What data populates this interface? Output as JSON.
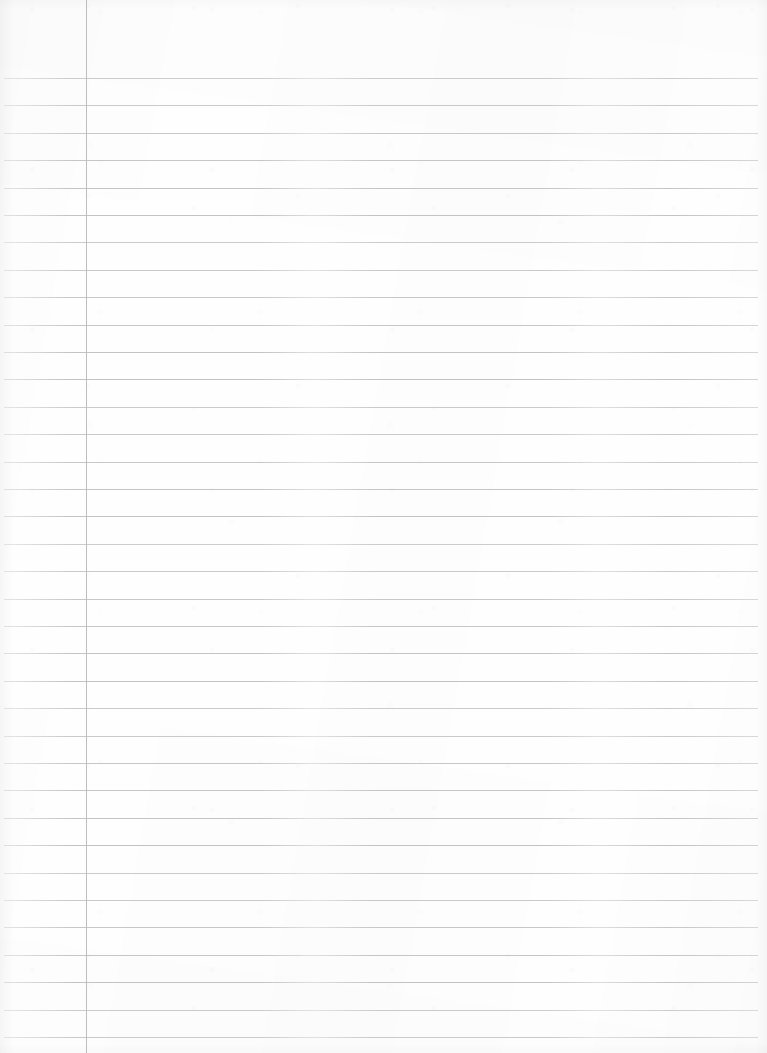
{
  "document": {
    "kind": "lined-notebook-paper",
    "title": "Blank ruled notebook page",
    "page_width": 767,
    "page_height": 1053,
    "orientation": "portrait",
    "visible_text": "",
    "content_note": "no handwriting, no printed text, no headings — page is entirely blank"
  },
  "paper": {
    "background_color": "#fefefe",
    "edge_tint_color": "#f3f3f4",
    "texture": "faint scan grain"
  },
  "ruling": {
    "style": "wide ruled with single left margin rule",
    "line_color": "#bfc0c4",
    "line_thickness_px": 1,
    "line_spacing_px": 27.4,
    "first_line_y": 78,
    "line_count": 36,
    "line_start_x": 4,
    "line_end_x": 758,
    "line_y_positions": [
      78,
      105.4,
      132.8,
      160.2,
      187.6,
      215,
      242.4,
      269.8,
      297.2,
      324.6,
      352,
      379.4,
      406.8,
      434.2,
      461.6,
      489,
      516.4,
      543.8,
      571.2,
      598.6,
      626,
      653.4,
      680.8,
      708.2,
      735.6,
      763,
      790.4,
      817.8,
      845.2,
      872.6,
      900,
      927.4,
      954.8,
      982.2,
      1009.6,
      1037
    ]
  },
  "margin_rule": {
    "color": "#b9babf",
    "thickness_px": 1,
    "x": 86,
    "y_start": 0,
    "y_end": 1053,
    "orientation": "vertical"
  },
  "regions": {
    "header_area": {
      "label": "header-area",
      "x": 0,
      "y": 0,
      "width": 767,
      "height": 78,
      "description": "unruled blank band above the first line"
    },
    "left_margin": {
      "label": "left-margin",
      "x": 0,
      "y": 0,
      "width": 86,
      "height": 1053,
      "description": "narrow column left of the vertical margin rule"
    },
    "writing_area": {
      "label": "writing-area",
      "x": 87,
      "y": 78,
      "width": 671,
      "height": 975,
      "description": "main ruled writing body right of the margin rule"
    }
  }
}
